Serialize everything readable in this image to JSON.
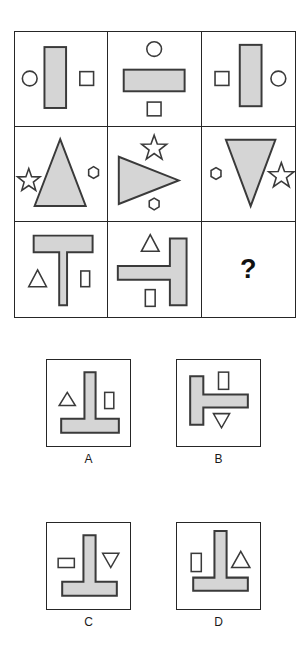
{
  "puzzle": {
    "type": "visual-analogy-matrix",
    "colors": {
      "shape_fill": "#d5d5d5",
      "shape_stroke": "#3a3a3a",
      "grid_stroke": "#262626",
      "background": "#ffffff",
      "text": "#111111"
    },
    "matrix": {
      "rows": 3,
      "columns": 3,
      "cells": [
        {
          "id": "cell-1-1",
          "name": "matrix-cell-row1-col1",
          "description": "Vertical filled rectangle with small circle outline at left and small square outline at right",
          "shapes": [
            "vertical-rectangle",
            "circle-outline-left",
            "square-outline-right"
          ]
        },
        {
          "id": "cell-1-2",
          "name": "matrix-cell-row1-col2",
          "description": "Horizontal filled rectangle with small circle outline above and small square outline below",
          "shapes": [
            "horizontal-rectangle",
            "circle-outline-top",
            "square-outline-bottom"
          ]
        },
        {
          "id": "cell-1-3",
          "name": "matrix-cell-row1-col3",
          "description": "Vertical filled rectangle with small square outline at left and small circle outline at right",
          "shapes": [
            "vertical-rectangle",
            "square-outline-left",
            "circle-outline-right"
          ]
        },
        {
          "id": "cell-2-1",
          "name": "matrix-cell-row2-col1",
          "description": "Filled triangle pointing up with star outline at left and hexagon outline at right",
          "shapes": [
            "triangle-up",
            "star-outline-left",
            "hexagon-outline-right"
          ]
        },
        {
          "id": "cell-2-2",
          "name": "matrix-cell-row2-col2",
          "description": "Filled triangle pointing right with star outline above and hexagon outline below",
          "shapes": [
            "triangle-right",
            "star-outline-top",
            "hexagon-outline-bottom"
          ]
        },
        {
          "id": "cell-2-3",
          "name": "matrix-cell-row2-col3",
          "description": "Filled triangle pointing down with hexagon outline at left and star outline at right",
          "shapes": [
            "triangle-down",
            "hexagon-outline-left",
            "star-outline-right"
          ]
        },
        {
          "id": "cell-3-1",
          "name": "matrix-cell-row3-col1",
          "description": "Filled T shape upright with small triangle outline at left and small vertical rectangle outline at right",
          "shapes": [
            "t-shape-up",
            "triangle-outline-left",
            "rectangle-outline-right"
          ]
        },
        {
          "id": "cell-3-2",
          "name": "matrix-cell-row3-col2",
          "description": "Filled T shape rotated with bar on right, small triangle outline above and small rectangle outline below",
          "shapes": [
            "t-shape-rotated",
            "triangle-outline-top",
            "rectangle-outline-bottom"
          ]
        },
        {
          "id": "cell-3-3",
          "name": "matrix-cell-row3-col3",
          "description": "Unknown answer cell",
          "shapes": [],
          "question_mark": "?"
        }
      ]
    },
    "options": [
      {
        "id": "option-a",
        "label": "A",
        "description": "Upside-down T (stem up, bar at bottom) with small triangle outline at left and small vertical rectangle outline at right"
      },
      {
        "id": "option-b",
        "label": "B",
        "description": "T rotated with vertical bar at left and stem pointing right, small vertical rectangle outline at top and small downward triangle outline at bottom"
      },
      {
        "id": "option-c",
        "label": "C",
        "description": "Upside-down T with small horizontal rectangle outline at left and small downward triangle outline at right"
      },
      {
        "id": "option-d",
        "label": "D",
        "description": "Upside-down T with small vertical rectangle outline at left and small upward triangle outline at right"
      }
    ]
  }
}
